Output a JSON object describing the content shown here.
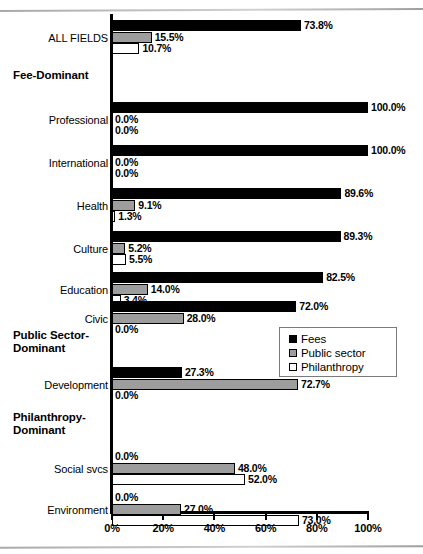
{
  "chart_data": {
    "type": "bar",
    "orientation": "horizontal",
    "title": "",
    "xlabel": "",
    "ylabel": "",
    "xlim": [
      0,
      100
    ],
    "xticks": [
      "0%",
      "20%",
      "40%",
      "60%",
      "80%",
      "100%"
    ],
    "xtick_values": [
      0,
      20,
      40,
      60,
      80,
      100
    ],
    "grid": false,
    "legend_position": "middle-right",
    "series": [
      {
        "name": "Fees",
        "color": "#000000"
      },
      {
        "name": "Public sector",
        "color": "#9d9d9d"
      },
      {
        "name": "Philanthropy",
        "color": "#ffffff"
      }
    ],
    "categories": [
      "ALL FIELDS",
      "Professional",
      "International",
      "Health",
      "Culture",
      "Education",
      "Civic",
      "Development",
      "Social svcs",
      "Environment"
    ],
    "group_headers": [
      {
        "label": "Fee-Dominant",
        "before_category": "Professional"
      },
      {
        "label": "Public Sector-\nDominant",
        "before_category": "Development"
      },
      {
        "label": "Philanthropy-\nDominant",
        "before_category": "Social svcs"
      }
    ],
    "values": {
      "Fees": [
        73.8,
        100.0,
        100.0,
        89.6,
        89.3,
        82.5,
        72.0,
        27.3,
        0.0,
        0.0
      ],
      "Public sector": [
        15.5,
        0.0,
        0.0,
        9.1,
        5.2,
        14.0,
        28.0,
        72.7,
        48.0,
        27.0
      ],
      "Philanthropy": [
        10.7,
        0.0,
        0.0,
        1.3,
        5.5,
        3.4,
        0.0,
        0.0,
        52.0,
        73.0
      ]
    },
    "value_labels": {
      "Fees": [
        "73.8%",
        "100.0%",
        "100.0%",
        "89.6%",
        "89.3%",
        "82.5%",
        "72.0%",
        "27.3%",
        "0.0%",
        "0.0%"
      ],
      "Public sector": [
        "15.5%",
        "0.0%",
        "0.0%",
        "9.1%",
        "5.2%",
        "14.0%",
        "28.0%",
        "72.7%",
        "48.0%",
        "27.0%"
      ],
      "Philanthropy": [
        "10.7%",
        "0.0%",
        "0.0%",
        "1.3%",
        "5.5%",
        "3.4%",
        "0.0%",
        "0.0%",
        "52.0%",
        "73.0%"
      ]
    }
  },
  "legend": {
    "items": [
      {
        "label": "Fees",
        "key": "fees"
      },
      {
        "label": "Public sector",
        "key": "public"
      },
      {
        "label": "Philanthropy",
        "key": "phil"
      }
    ]
  }
}
